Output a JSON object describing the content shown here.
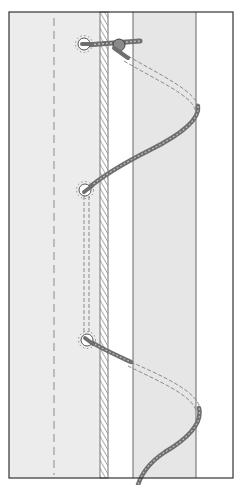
{
  "figure": {
    "colors": {
      "background": "#ffffff",
      "sail_fill": "#ececec",
      "mast_fill": "#e6e6e6",
      "frame": "#333333",
      "rope": "#6e6e6e",
      "rope_highlight": "#bdbdbd",
      "dashes": "#8a8a8a"
    },
    "grommets": [
      {
        "x": 84,
        "y": 44
      },
      {
        "x": 85,
        "y": 190
      },
      {
        "x": 87,
        "y": 340
      }
    ]
  }
}
